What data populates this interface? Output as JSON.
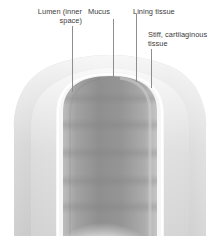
{
  "figure": {
    "width": 220,
    "height": 236,
    "background": "#ffffff"
  },
  "labels": [
    {
      "id": "lumen",
      "text": "Lumen (inner\nspace)",
      "align": "right",
      "color": "#3b3b3b"
    },
    {
      "id": "mucus",
      "text": "Mucus",
      "align": "left",
      "color": "#3b3b3b"
    },
    {
      "id": "lining",
      "text": "Lining tissue",
      "align": "left",
      "color": "#3b3b3b"
    },
    {
      "id": "cartilage",
      "text": "Stiff, cartilaginous\ntissue",
      "align": "left",
      "color": "#3b3b3b"
    }
  ],
  "leaders": [
    {
      "id": "leader-lumen",
      "x": 72,
      "y1": 26,
      "y2": 92,
      "color": "#8e8e8e"
    },
    {
      "id": "leader-mucus",
      "x": 113,
      "y1": 19,
      "y2": 78,
      "color": "#8e8e8e"
    },
    {
      "id": "leader-lining",
      "x": 136,
      "y1": 14,
      "y2": 82,
      "color": "#8e8e8e"
    },
    {
      "id": "leader-cartilage",
      "x": 151,
      "y1": 49,
      "y2": 88,
      "color": "#8e8e8e"
    }
  ],
  "anatomy": {
    "layers": [
      {
        "id": "outer-cartilage",
        "name": "Stiff, cartilaginous tissue",
        "color": "#c9c9c9"
      },
      {
        "id": "outer-pale",
        "name": "Outer pale band",
        "color": "#e8e8e8"
      },
      {
        "id": "lining-tissue",
        "name": "Lining tissue",
        "color": "#d6d6d6"
      },
      {
        "id": "mucus-layer",
        "name": "Mucus",
        "color": "#f4f4f4"
      },
      {
        "id": "lumen",
        "name": "Lumen (inner space)",
        "color": "#9a9a9a"
      },
      {
        "id": "lumen-floor",
        "name": "Lumen floor highlight",
        "color": "#ffffff"
      }
    ],
    "ring_count": 5
  }
}
